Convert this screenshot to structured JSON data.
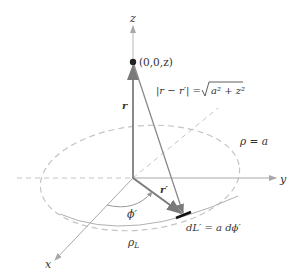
{
  "axes": {
    "z_label": "z",
    "y_label": "y",
    "x_label": "x"
  },
  "labels": {
    "point": "(0,0,z)",
    "r": "r",
    "r_prime": "r′",
    "distance_lhs": "|r − r′| =",
    "distance_rhs": "a² + z²",
    "rho_eq_a": "ρ = a",
    "phi_prime": "ϕ′",
    "rho_L": "ρ",
    "rho_L_sub": "L",
    "dL": "dL′ = a dϕ′"
  },
  "colors": {
    "axis": "#a8a8a8",
    "vector": "#8a8a8a",
    "dashed": "#c4c4c4",
    "point": "#222222",
    "segment": "#111111",
    "text": "#333333"
  }
}
